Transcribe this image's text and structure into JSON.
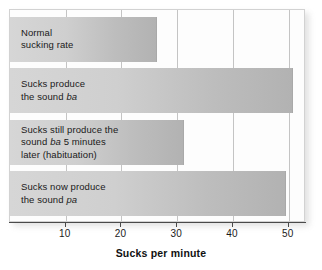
{
  "chart_data": {
    "type": "bar",
    "orientation": "horizontal",
    "title": "",
    "xlabel": "Sucks per minute",
    "ylabel": "",
    "xlim": [
      0,
      53.1
    ],
    "xticks": [
      10,
      20,
      30,
      40,
      50
    ],
    "xticklabels": [
      "10",
      "20",
      "30",
      "40",
      "50"
    ],
    "grid": "vertical",
    "legend": "none",
    "categories": [
      "Normal sucking rate",
      "Sucks produce the sound ba",
      "Sucks still produce the sound ba 5 minutes later (habituation)",
      "Sucks now produce the sound pa"
    ],
    "values": [
      26.3,
      50.7,
      31.3,
      49.6
    ],
    "bars": [
      {
        "value": 26.3,
        "label_lines": [
          [
            {
              "text": "Normal",
              "italic": false
            }
          ],
          [
            {
              "text": "sucking rate",
              "italic": false
            }
          ]
        ]
      },
      {
        "value": 50.7,
        "label_lines": [
          [
            {
              "text": "Sucks produce",
              "italic": false
            }
          ],
          [
            {
              "text": "the sound ",
              "italic": false
            },
            {
              "text": "ba",
              "italic": true
            }
          ]
        ]
      },
      {
        "value": 31.3,
        "label_lines": [
          [
            {
              "text": "Sucks still produce the",
              "italic": false
            }
          ],
          [
            {
              "text": "sound ",
              "italic": false
            },
            {
              "text": "ba",
              "italic": true
            },
            {
              "text": " 5 minutes",
              "italic": false
            }
          ],
          [
            {
              "text": "later (habituation)",
              "italic": false
            }
          ]
        ]
      },
      {
        "value": 49.6,
        "label_lines": [
          [
            {
              "text": "Sucks now produce",
              "italic": false
            }
          ],
          [
            {
              "text": "the sound ",
              "italic": false
            },
            {
              "text": "pa",
              "italic": true
            }
          ]
        ]
      }
    ],
    "colors": {
      "bar_gradient_light": "#d6d6d6",
      "bar_gradient_dark": "#b2b2b2",
      "bar_edge": "#a9a9a9",
      "gridline": "#c4c4c4",
      "axis": "#4a4a4a",
      "plot_background": "#fdfdfd",
      "plot_border": "#d2d2d2",
      "text": "#1a1a1a",
      "page_background": "#ffffff"
    }
  }
}
